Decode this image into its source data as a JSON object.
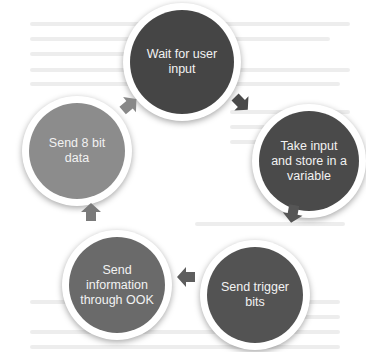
{
  "diagram": {
    "type": "cycle",
    "nodes": [
      {
        "id": "wait",
        "label": "Wait for user input",
        "lines": [
          "Wait for user",
          "input"
        ],
        "color": "#454545"
      },
      {
        "id": "take",
        "label": "Take input and store in a variable",
        "lines": [
          "Take input",
          "and store in a",
          "variable"
        ],
        "color": "#4a4a4a"
      },
      {
        "id": "trigger",
        "label": "Send trigger bits",
        "lines": [
          "Send trigger",
          "bits"
        ],
        "color": "#535353"
      },
      {
        "id": "ook",
        "label": "Send information through OOK",
        "lines": [
          "Send",
          "information",
          "through OOK"
        ],
        "color": "#6a6a6a"
      },
      {
        "id": "data",
        "label": "Send 8 bit data",
        "lines": [
          "Send 8 bit",
          "data"
        ],
        "color": "#8c8c8c"
      }
    ],
    "edges": [
      {
        "from": "wait",
        "to": "take"
      },
      {
        "from": "take",
        "to": "trigger"
      },
      {
        "from": "trigger",
        "to": "ook"
      },
      {
        "from": "ook",
        "to": "data"
      },
      {
        "from": "data",
        "to": "wait"
      }
    ],
    "arrow_colors": {
      "wait_take": "#4a4a4a",
      "take_trigger": "#555555",
      "trigger_ook": "#5e5e5e",
      "ook_data": "#7a7a7a",
      "data_wait": "#888888"
    }
  }
}
